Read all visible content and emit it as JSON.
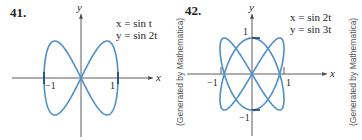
{
  "figures": [
    {
      "number": "41.",
      "x_eq": "x = sin t",
      "y_eq": "y = sin 2t",
      "x_label": "x",
      "y_label": "y",
      "ticks": {
        "x_neg": "−1",
        "x_pos": "1"
      },
      "credit": "(Generated by Mathematica)"
    },
    {
      "number": "42.",
      "x_eq": "x = sin 2t",
      "y_eq": "y = sin 3t",
      "x_label": "x",
      "y_label": "y",
      "ticks": {
        "x_neg": "−1",
        "x_pos": "1",
        "y_pos": "1",
        "y_neg": "−1"
      },
      "credit": "(Generated by Mathematica)"
    }
  ],
  "colors": {
    "curve": "#4f8fca",
    "axis": "#4a4a4a",
    "text": "#231f20"
  },
  "chart_data": [
    {
      "type": "line",
      "title": "41. x = sin t, y = sin 2t",
      "xlabel": "x",
      "ylabel": "y",
      "xlim": [
        -1.1,
        1.1
      ],
      "ylim": [
        -1.1,
        1.1
      ],
      "grid": false,
      "parametric": {
        "x": "sin t",
        "y": "sin 2t",
        "t_range": [
          0,
          6.2832
        ]
      },
      "x_ticks": [
        "-1",
        "1"
      ],
      "y_ticks": [],
      "annotations": [
        "(Generated by Mathematica)"
      ]
    },
    {
      "type": "line",
      "title": "42. x = sin 2t, y = sin 3t",
      "xlabel": "x",
      "ylabel": "y",
      "xlim": [
        -1.1,
        1.1
      ],
      "ylim": [
        -1.1,
        1.1
      ],
      "grid": false,
      "parametric": {
        "x": "sin 2t",
        "y": "sin 3t",
        "t_range": [
          0,
          6.2832
        ]
      },
      "x_ticks": [
        "-1",
        "1"
      ],
      "y_ticks": [
        "-1",
        "1"
      ],
      "annotations": [
        "(Generated by Mathematica)"
      ]
    }
  ]
}
